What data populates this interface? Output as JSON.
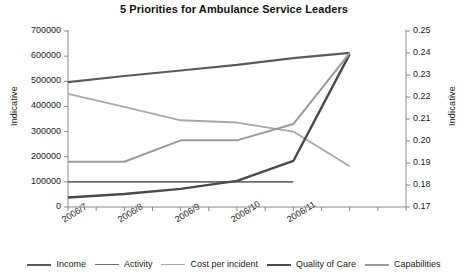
{
  "chart_data": {
    "type": "line",
    "title": "5 Priorities for Ambulance Service Leaders",
    "xlabel": "",
    "ylabel": "Indicative",
    "y2label": "Indicative",
    "grid": false,
    "legend_position": "bottom",
    "x": [
      "2006/7",
      "2006/8",
      "2006/9",
      "2006/10",
      "2006/11"
    ],
    "xtick_labels": [
      "2006/7",
      "2006/8",
      "2006/9",
      "2006/10",
      "2006/11"
    ],
    "ylim": [
      0,
      700000
    ],
    "ytick_labels": [
      "700000",
      "600000",
      "500000",
      "400000",
      "300000",
      "200000",
      "100000",
      "0"
    ],
    "ytick_values": [
      700000,
      600000,
      500000,
      400000,
      300000,
      200000,
      100000,
      0
    ],
    "y2lim": [
      0.17,
      0.25
    ],
    "y2tick_labels": [
      "0.25",
      "0.24",
      "0.23",
      "0.22",
      "0.21",
      "0.20",
      "0.19",
      "0.18",
      "0.17"
    ],
    "y2tick_values": [
      0.25,
      0.24,
      0.23,
      0.22,
      0.21,
      0.2,
      0.19,
      0.18,
      0.17
    ],
    "series": [
      {
        "name": "Income",
        "color": "#5a5a5a",
        "width": 2.2,
        "axis": "left",
        "x": [
          0,
          1,
          2,
          3,
          4,
          5
        ],
        "values": [
          497000,
          521000,
          543000,
          565000,
          592000,
          613000
        ]
      },
      {
        "name": "Activity",
        "color": "#6e6e6e",
        "width": 1.6,
        "axis": "left",
        "x": [
          0,
          1,
          2,
          3,
          4
        ],
        "values": [
          100000,
          100000,
          100000,
          100000,
          100000
        ]
      },
      {
        "name": "Cost per incident",
        "color": "#a8a8a8",
        "width": 1.8,
        "axis": "left",
        "x": [
          0,
          1,
          2,
          3,
          4,
          5
        ],
        "values": [
          450000,
          398000,
          345000,
          336000,
          300000,
          162000
        ]
      },
      {
        "name": "Quality of Care",
        "color": "#4a4a4a",
        "width": 2.4,
        "axis": "left",
        "x": [
          0,
          1,
          2,
          3,
          4,
          5
        ],
        "values": [
          38000,
          52000,
          72000,
          104000,
          183000,
          608000
        ]
      },
      {
        "name": "Capabilities",
        "color": "#9a9a9a",
        "width": 2.0,
        "axis": "left",
        "x": [
          0,
          1,
          2,
          3,
          4,
          5
        ],
        "values": [
          180000,
          180000,
          265000,
          265000,
          330000,
          612000
        ]
      }
    ]
  },
  "legend": {
    "items": [
      {
        "label": "Income"
      },
      {
        "label": "Activity"
      },
      {
        "label": "Cost per incident"
      },
      {
        "label": "Quality of Care"
      },
      {
        "label": "Capabilities"
      }
    ]
  }
}
